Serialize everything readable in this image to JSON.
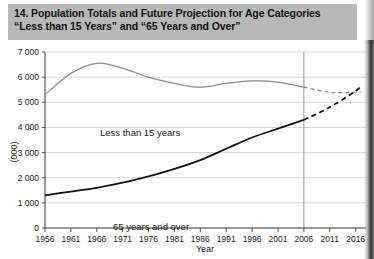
{
  "figure": {
    "number_and_title_line1": "14. Population Totals and Future Projection for Age Categories",
    "title_line2": "“Less than 15 Years” and “65 Years and Over”",
    "title_bg_color": "#b8b8b8"
  },
  "chart_data": {
    "type": "line",
    "title": "14. Population Totals and Future Projection for Age Categories “Less than 15 Years” and “65 Years and Over”",
    "xlabel": "Year",
    "ylabel": "(000)",
    "xlim": [
      1956,
      2018
    ],
    "ylim": [
      0,
      7000
    ],
    "yticks": [
      0,
      1000,
      2000,
      3000,
      4000,
      5000,
      6000,
      7000
    ],
    "ytick_labels": [
      "0",
      "1 000",
      "2 000",
      "3 000",
      "4 000",
      "5 000",
      "6 000",
      "7 000"
    ],
    "xticks": [
      1956,
      1961,
      1966,
      1971,
      1976,
      1981,
      1986,
      1991,
      1996,
      2001,
      2006,
      2011,
      2016
    ],
    "xtick_labels": [
      "1956",
      "1961",
      "1966",
      "1971",
      "1976",
      "1981",
      "1986",
      "1991",
      "1996",
      "2001",
      "2006",
      "2011",
      "2016"
    ],
    "grid": "horizontal",
    "legend": "inline-annotations",
    "projection_start_year": 2006,
    "projection_divider": true,
    "series": [
      {
        "name": "Less than 15 years",
        "color": "#8a8a8a",
        "annotation": "Less than 15 years",
        "actual": {
          "x": [
            1956,
            1961,
            1966,
            1971,
            1976,
            1981,
            1986,
            1991,
            1996,
            2001,
            2006
          ],
          "y": [
            5300,
            6150,
            6550,
            6350,
            6000,
            5750,
            5600,
            5750,
            5850,
            5800,
            5600
          ]
        },
        "projection": {
          "x": [
            2006,
            2011,
            2016,
            2017
          ],
          "y": [
            5600,
            5400,
            5400,
            5420
          ],
          "style": "dashed"
        }
      },
      {
        "name": "65 years and over",
        "color": "#111111",
        "annotation": "65 years and over",
        "actual": {
          "x": [
            1956,
            1961,
            1966,
            1971,
            1976,
            1981,
            1986,
            1991,
            1996,
            2001,
            2006
          ],
          "y": [
            1300,
            1450,
            1600,
            1800,
            2050,
            2350,
            2700,
            3150,
            3600,
            3950,
            4300
          ]
        },
        "projection": {
          "x": [
            2006,
            2011,
            2016,
            2017
          ],
          "y": [
            4300,
            4800,
            5450,
            5650
          ],
          "style": "dashed"
        }
      }
    ]
  },
  "axis": {
    "y_unit_label": "(000)",
    "x_axis_label": "Year"
  }
}
